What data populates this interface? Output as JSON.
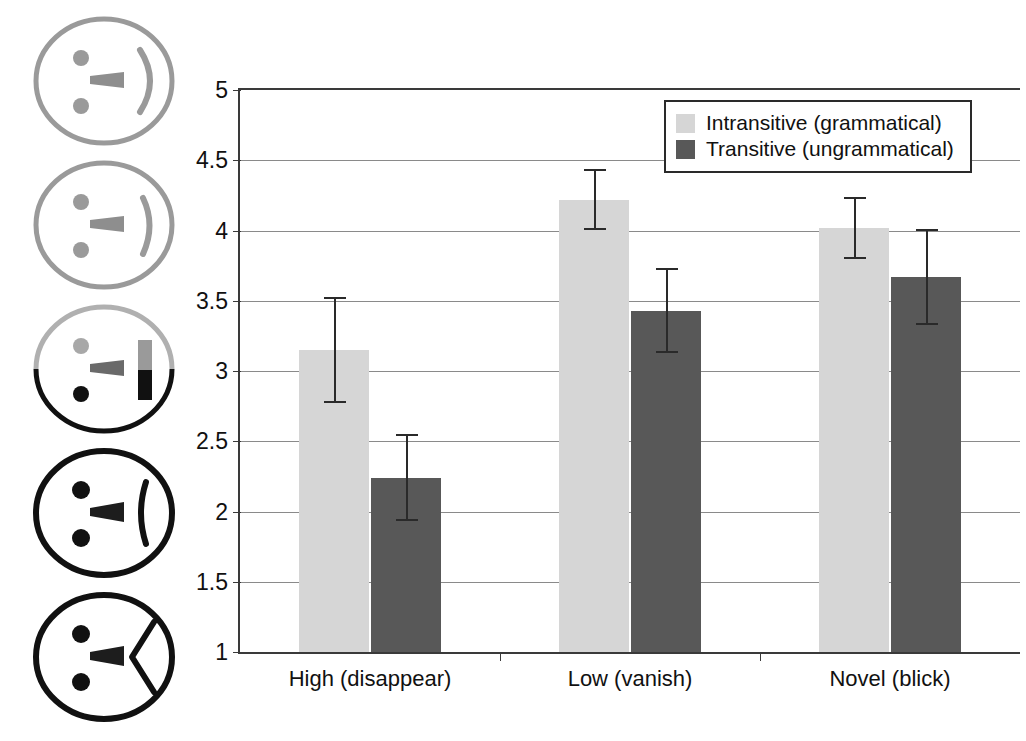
{
  "chart_data": {
    "type": "bar",
    "title": "",
    "xlabel": "",
    "ylabel": "",
    "ylim": [
      1,
      5
    ],
    "grid": true,
    "legend_position": "top-right",
    "categories": [
      "High (disappear)",
      "Low (vanish)",
      "Novel (blick)"
    ],
    "ytick_labels": [
      "1",
      "1.5",
      "2",
      "2.5",
      "3",
      "3.5",
      "4",
      "4.5",
      "5"
    ],
    "ytick_values": [
      1,
      1.5,
      2,
      2.5,
      3,
      3.5,
      4,
      4.5,
      5
    ],
    "series": [
      {
        "name": "Intransitive (grammatical)",
        "color": "#d6d6d6",
        "values": [
          3.15,
          4.22,
          4.02
        ],
        "errors": [
          0.38,
          0.22,
          0.22
        ]
      },
      {
        "name": "Transitive (ungrammatical)",
        "color": "#585858",
        "values": [
          2.24,
          3.43,
          3.67
        ],
        "errors": [
          0.31,
          0.3,
          0.34
        ]
      }
    ]
  },
  "legend": {
    "items": [
      {
        "label": "Intransitive (grammatical)",
        "swatch": "light"
      },
      {
        "label": "Transitive (ungrammatical)",
        "swatch": "dark"
      }
    ]
  },
  "face_scale": {
    "description": "Five-point smiley rating scale illustration",
    "faces": [
      {
        "name": "face-happy-light-1",
        "expression": "smile",
        "outline": "#9a9a9a",
        "mouth": "smile"
      },
      {
        "name": "face-happy-light-2",
        "expression": "smile",
        "outline": "#9a9a9a",
        "mouth": "smile"
      },
      {
        "name": "face-neutral",
        "expression": "neutral",
        "outline": "split",
        "mouth": "straight"
      },
      {
        "name": "face-frown-dark-1",
        "expression": "frown",
        "outline": "#111111",
        "mouth": "frown"
      },
      {
        "name": "face-frown-dark-2",
        "expression": "frown",
        "outline": "#111111",
        "mouth": "deep-frown"
      }
    ]
  },
  "colors": {
    "light_bar": "#d6d6d6",
    "dark_bar": "#585858",
    "axis": "#3a3a3a",
    "gridline": "#8a8a8a"
  }
}
